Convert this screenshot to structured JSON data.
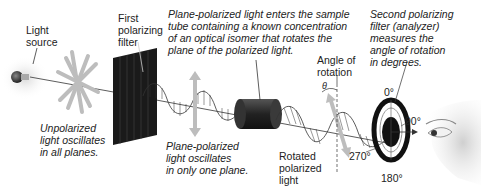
{
  "labels": {
    "light_source": [
      "Light",
      "source"
    ],
    "first_filter": [
      "First",
      "polarizing",
      "filter"
    ],
    "sample_tube_caption": [
      "Plane-polarized light enters the sample",
      "tube containing a known concentration",
      "of an optical isomer that rotates the",
      "plane of the polarized light."
    ],
    "second_filter_caption": [
      "Second polarizing",
      "filter (analyzer)",
      "measures the",
      "angle of rotation",
      "in degrees."
    ],
    "unpolarized_caption": [
      "Unpolarized",
      "light oscillates",
      "in all planes."
    ],
    "plane_polarized_caption": [
      "Plane-polarized",
      "light oscillates",
      "in only one plane."
    ],
    "rotated_light": [
      "Rotated",
      "polarized",
      "light"
    ],
    "angle_of_rotation": [
      "Angle of",
      "rotation"
    ],
    "theta": "θ",
    "dial": {
      "top": "0°",
      "right": "90°",
      "bottom": "180°",
      "left": "270°"
    }
  },
  "colors": {
    "filter": "#1a1a1a",
    "tube": "#2b2b2b",
    "arrow_gray": "#b8b8b8",
    "beam": "#333333"
  }
}
